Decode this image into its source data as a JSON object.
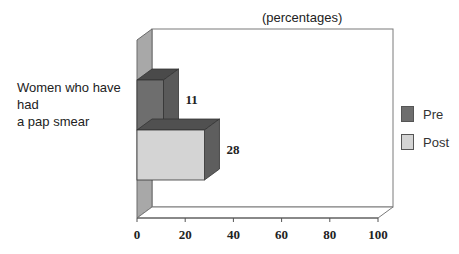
{
  "chart_data": {
    "type": "bar",
    "orientation": "horizontal",
    "style": "3d-clustered",
    "title": "(percentages)",
    "xlabel": "",
    "ylabel": "",
    "categories": [
      "Women who have had a pap smear"
    ],
    "series": [
      {
        "name": "Pre",
        "values": [
          11
        ],
        "color": "#6e6e6e"
      },
      {
        "name": "Post",
        "values": [
          28
        ],
        "color": "#d4d4d4"
      }
    ],
    "data_labels": [
      "11",
      "28"
    ],
    "xlim": [
      0,
      100
    ],
    "x_ticks": [
      "0",
      "20",
      "40",
      "60",
      "80",
      "100"
    ],
    "grid": false,
    "legend_position": "right"
  },
  "title": "(percentages)",
  "category_label_line1": "Women who have had",
  "category_label_line2": "a pap smear",
  "legend": [
    {
      "label": "Pre",
      "color": "#6e6e6e"
    },
    {
      "label": "Post",
      "color": "#d4d4d4"
    }
  ],
  "colors": {
    "pre_front": "#6e6e6e",
    "pre_side": "#5a5a5a",
    "pre_top": "#4a4a4a",
    "post_front": "#d4d4d4",
    "post_side": "#5e5e5e",
    "post_top": "#505050",
    "wall_left": "#a8a8a8",
    "axis": "#555555"
  }
}
